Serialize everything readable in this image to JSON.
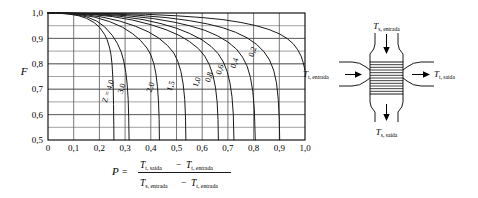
{
  "figure": {
    "kind": "lmtd-correction-factor-chart",
    "colors": {
      "axis": "#000000",
      "grid": "#555555",
      "curve": "#1a1a1a",
      "background": "#ffffff"
    }
  },
  "chart_data": {
    "type": "line",
    "title": "",
    "xlabel": "P",
    "ylabel": "F",
    "xlim": [
      0,
      1
    ],
    "ylim": [
      0.5,
      1.0
    ],
    "grid": true,
    "legend": "inline-curve-labels",
    "x_ticks": [
      "0",
      "0,1",
      "0,2",
      "0,3",
      "0,4",
      "0,5",
      "0,6",
      "0,7",
      "0,8",
      "0,9",
      "1,0"
    ],
    "x_tick_values": [
      0,
      0.1,
      0.2,
      0.3,
      0.4,
      0.5,
      0.6,
      0.7,
      0.8,
      0.9,
      1.0
    ],
    "y_ticks": [
      "0,5",
      "0,6",
      "0,7",
      "0,8",
      "0,9",
      "1,0"
    ],
    "y_tick_values": [
      0.5,
      0.6,
      0.7,
      0.8,
      0.9,
      1.0
    ],
    "minor_y_step": 0.05,
    "series": [
      {
        "name": "Z = 4,0",
        "z": 4.0,
        "label": "Z = 4,0",
        "label_pos": {
          "p": 0.243,
          "f": 0.69
        },
        "points": [
          {
            "p": 0.0,
            "f": 1.0
          },
          {
            "p": 0.04,
            "f": 0.999
          },
          {
            "p": 0.08,
            "f": 0.996
          },
          {
            "p": 0.12,
            "f": 0.989
          },
          {
            "p": 0.15,
            "f": 0.979
          },
          {
            "p": 0.18,
            "f": 0.962
          },
          {
            "p": 0.2,
            "f": 0.944
          },
          {
            "p": 0.22,
            "f": 0.916
          },
          {
            "p": 0.23,
            "f": 0.895
          },
          {
            "p": 0.24,
            "f": 0.862
          },
          {
            "p": 0.245,
            "f": 0.836
          },
          {
            "p": 0.249,
            "f": 0.8
          },
          {
            "p": 0.252,
            "f": 0.75
          },
          {
            "p": 0.254,
            "f": 0.7
          },
          {
            "p": 0.255,
            "f": 0.64
          },
          {
            "p": 0.256,
            "f": 0.56
          },
          {
            "p": 0.2565,
            "f": 0.5
          }
        ]
      },
      {
        "name": "3,0",
        "z": 3.0,
        "label": "3,0",
        "label_pos": {
          "p": 0.296,
          "f": 0.7
        },
        "points": [
          {
            "p": 0.0,
            "f": 1.0
          },
          {
            "p": 0.05,
            "f": 0.999
          },
          {
            "p": 0.1,
            "f": 0.995
          },
          {
            "p": 0.15,
            "f": 0.985
          },
          {
            "p": 0.19,
            "f": 0.968
          },
          {
            "p": 0.22,
            "f": 0.946
          },
          {
            "p": 0.25,
            "f": 0.912
          },
          {
            "p": 0.27,
            "f": 0.88
          },
          {
            "p": 0.285,
            "f": 0.846
          },
          {
            "p": 0.295,
            "f": 0.81
          },
          {
            "p": 0.303,
            "f": 0.765
          },
          {
            "p": 0.308,
            "f": 0.72
          },
          {
            "p": 0.312,
            "f": 0.66
          },
          {
            "p": 0.314,
            "f": 0.59
          },
          {
            "p": 0.3155,
            "f": 0.5
          }
        ]
      },
      {
        "name": "2,0",
        "z": 2.0,
        "label": "2,0",
        "label_pos": {
          "p": 0.408,
          "f": 0.705
        },
        "points": [
          {
            "p": 0.0,
            "f": 1.0
          },
          {
            "p": 0.06,
            "f": 0.999
          },
          {
            "p": 0.12,
            "f": 0.994
          },
          {
            "p": 0.18,
            "f": 0.984
          },
          {
            "p": 0.24,
            "f": 0.966
          },
          {
            "p": 0.29,
            "f": 0.944
          },
          {
            "p": 0.33,
            "f": 0.918
          },
          {
            "p": 0.36,
            "f": 0.892
          },
          {
            "p": 0.385,
            "f": 0.862
          },
          {
            "p": 0.4,
            "f": 0.835
          },
          {
            "p": 0.412,
            "f": 0.8
          },
          {
            "p": 0.42,
            "f": 0.76
          },
          {
            "p": 0.426,
            "f": 0.71
          },
          {
            "p": 0.43,
            "f": 0.65
          },
          {
            "p": 0.4325,
            "f": 0.58
          },
          {
            "p": 0.4335,
            "f": 0.5
          }
        ]
      },
      {
        "name": "1,5",
        "z": 1.5,
        "label": "1,5",
        "label_pos": {
          "p": 0.487,
          "f": 0.71
        },
        "points": [
          {
            "p": 0.0,
            "f": 1.0
          },
          {
            "p": 0.07,
            "f": 0.999
          },
          {
            "p": 0.14,
            "f": 0.994
          },
          {
            "p": 0.21,
            "f": 0.984
          },
          {
            "p": 0.28,
            "f": 0.968
          },
          {
            "p": 0.34,
            "f": 0.948
          },
          {
            "p": 0.39,
            "f": 0.926
          },
          {
            "p": 0.43,
            "f": 0.902
          },
          {
            "p": 0.465,
            "f": 0.872
          },
          {
            "p": 0.49,
            "f": 0.842
          },
          {
            "p": 0.505,
            "f": 0.81
          },
          {
            "p": 0.517,
            "f": 0.77
          },
          {
            "p": 0.526,
            "f": 0.72
          },
          {
            "p": 0.532,
            "f": 0.66
          },
          {
            "p": 0.535,
            "f": 0.59
          },
          {
            "p": 0.5365,
            "f": 0.5
          }
        ]
      },
      {
        "name": "1,0",
        "z": 1.0,
        "label": "1,0",
        "label_pos": {
          "p": 0.588,
          "f": 0.725
        },
        "points": [
          {
            "p": 0.0,
            "f": 1.0
          },
          {
            "p": 0.08,
            "f": 0.999
          },
          {
            "p": 0.16,
            "f": 0.995
          },
          {
            "p": 0.25,
            "f": 0.986
          },
          {
            "p": 0.33,
            "f": 0.972
          },
          {
            "p": 0.4,
            "f": 0.954
          },
          {
            "p": 0.46,
            "f": 0.934
          },
          {
            "p": 0.51,
            "f": 0.912
          },
          {
            "p": 0.55,
            "f": 0.888
          },
          {
            "p": 0.585,
            "f": 0.86
          },
          {
            "p": 0.61,
            "f": 0.83
          },
          {
            "p": 0.628,
            "f": 0.796
          },
          {
            "p": 0.642,
            "f": 0.755
          },
          {
            "p": 0.652,
            "f": 0.705
          },
          {
            "p": 0.658,
            "f": 0.65
          },
          {
            "p": 0.6615,
            "f": 0.58
          },
          {
            "p": 0.663,
            "f": 0.5
          }
        ]
      },
      {
        "name": "0,8",
        "z": 0.8,
        "label": "0,8",
        "label_pos": {
          "p": 0.635,
          "f": 0.745
        },
        "points": [
          {
            "p": 0.0,
            "f": 1.0
          },
          {
            "p": 0.09,
            "f": 0.999
          },
          {
            "p": 0.18,
            "f": 0.995
          },
          {
            "p": 0.28,
            "f": 0.987
          },
          {
            "p": 0.37,
            "f": 0.974
          },
          {
            "p": 0.44,
            "f": 0.958
          },
          {
            "p": 0.5,
            "f": 0.94
          },
          {
            "p": 0.55,
            "f": 0.92
          },
          {
            "p": 0.6,
            "f": 0.894
          },
          {
            "p": 0.635,
            "f": 0.868
          },
          {
            "p": 0.662,
            "f": 0.84
          },
          {
            "p": 0.682,
            "f": 0.808
          },
          {
            "p": 0.697,
            "f": 0.77
          },
          {
            "p": 0.708,
            "f": 0.725
          },
          {
            "p": 0.716,
            "f": 0.67
          },
          {
            "p": 0.721,
            "f": 0.6
          },
          {
            "p": 0.7235,
            "f": 0.5
          }
        ]
      },
      {
        "name": "0,6",
        "z": 0.6,
        "label": "0,6",
        "label_pos": {
          "p": 0.678,
          "f": 0.775
        },
        "points": [
          {
            "p": 0.0,
            "f": 1.0
          },
          {
            "p": 0.1,
            "f": 0.999
          },
          {
            "p": 0.2,
            "f": 0.996
          },
          {
            "p": 0.31,
            "f": 0.989
          },
          {
            "p": 0.41,
            "f": 0.978
          },
          {
            "p": 0.49,
            "f": 0.964
          },
          {
            "p": 0.55,
            "f": 0.95
          },
          {
            "p": 0.61,
            "f": 0.932
          },
          {
            "p": 0.66,
            "f": 0.91
          },
          {
            "p": 0.7,
            "f": 0.886
          },
          {
            "p": 0.733,
            "f": 0.858
          },
          {
            "p": 0.757,
            "f": 0.826
          },
          {
            "p": 0.775,
            "f": 0.79
          },
          {
            "p": 0.788,
            "f": 0.745
          },
          {
            "p": 0.797,
            "f": 0.69
          },
          {
            "p": 0.803,
            "f": 0.62
          },
          {
            "p": 0.8065,
            "f": 0.5
          }
        ]
      },
      {
        "name": "0,4",
        "z": 0.4,
        "label": "0,4",
        "label_pos": {
          "p": 0.735,
          "f": 0.8
        },
        "points": [
          {
            "p": 0.0,
            "f": 1.0
          },
          {
            "p": 0.11,
            "f": 0.999
          },
          {
            "p": 0.23,
            "f": 0.997
          },
          {
            "p": 0.35,
            "f": 0.991
          },
          {
            "p": 0.46,
            "f": 0.982
          },
          {
            "p": 0.55,
            "f": 0.97
          },
          {
            "p": 0.62,
            "f": 0.957
          },
          {
            "p": 0.68,
            "f": 0.942
          },
          {
            "p": 0.73,
            "f": 0.924
          },
          {
            "p": 0.775,
            "f": 0.902
          },
          {
            "p": 0.812,
            "f": 0.876
          },
          {
            "p": 0.84,
            "f": 0.848
          },
          {
            "p": 0.862,
            "f": 0.815
          },
          {
            "p": 0.878,
            "f": 0.775
          },
          {
            "p": 0.889,
            "f": 0.725
          },
          {
            "p": 0.896,
            "f": 0.66
          },
          {
            "p": 0.9,
            "f": 0.58
          },
          {
            "p": 0.9015,
            "f": 0.5
          }
        ]
      },
      {
        "name": "0,2",
        "z": 0.2,
        "label": "0,2",
        "label_pos": {
          "p": 0.805,
          "f": 0.845
        },
        "points": [
          {
            "p": 0.0,
            "f": 1.0
          },
          {
            "p": 0.12,
            "f": 0.999
          },
          {
            "p": 0.25,
            "f": 0.998
          },
          {
            "p": 0.38,
            "f": 0.995
          },
          {
            "p": 0.5,
            "f": 0.989
          },
          {
            "p": 0.6,
            "f": 0.982
          },
          {
            "p": 0.68,
            "f": 0.974
          },
          {
            "p": 0.75,
            "f": 0.963
          },
          {
            "p": 0.81,
            "f": 0.95
          },
          {
            "p": 0.86,
            "f": 0.935
          },
          {
            "p": 0.9,
            "f": 0.918
          },
          {
            "p": 0.93,
            "f": 0.9
          },
          {
            "p": 0.955,
            "f": 0.878
          },
          {
            "p": 0.972,
            "f": 0.855
          },
          {
            "p": 0.985,
            "f": 0.83
          },
          {
            "p": 0.993,
            "f": 0.805
          },
          {
            "p": 1.0,
            "f": 0.775
          }
        ]
      }
    ]
  },
  "formula": {
    "lhs": "P",
    "equals": "=",
    "minus": "−",
    "numerator": [
      {
        "var": "T",
        "sub": "t, saída"
      },
      {
        "var": "T",
        "sub": "t, entrada"
      }
    ],
    "denominator": [
      {
        "var": "T",
        "sub": "s, entrada"
      },
      {
        "var": "T",
        "sub": "t, entrada"
      }
    ]
  },
  "diagram": {
    "name": "cross-flow-heat-exchanger",
    "labels": {
      "top": {
        "var": "T",
        "sub": "s, entrada"
      },
      "bottom": {
        "var": "T",
        "sub": "s, saída"
      },
      "left": {
        "var": "T",
        "sub": "t, entrada"
      },
      "right": {
        "var": "T",
        "sub": "t, saída"
      }
    },
    "core_hatch_lines": 11
  }
}
